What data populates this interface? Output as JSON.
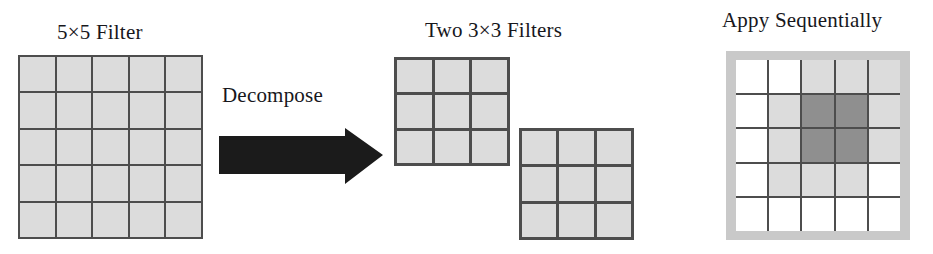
{
  "figure": {
    "kind": "filter-decomposition-diagram",
    "panels": {
      "source": {
        "title": "5×5 Filter",
        "rows": 5,
        "cols": 5,
        "cell_shades": [
          [
            "light",
            "light",
            "light",
            "light",
            "light"
          ],
          [
            "light",
            "light",
            "light",
            "light",
            "light"
          ],
          [
            "light",
            "light",
            "light",
            "light",
            "light"
          ],
          [
            "light",
            "light",
            "light",
            "light",
            "light"
          ],
          [
            "light",
            "light",
            "light",
            "light",
            "light"
          ]
        ]
      },
      "transform": {
        "label": "Decompose",
        "arrow_icon": "right-arrow-icon",
        "arrow_color": "#1b1b1b",
        "direction": "right"
      },
      "decomposed": {
        "title": "Two 3×3 Filters",
        "filters": [
          {
            "name": "first-3x3-filter",
            "rows": 3,
            "cols": 3,
            "cell_shades": [
              [
                "light",
                "light",
                "light"
              ],
              [
                "light",
                "light",
                "light"
              ],
              [
                "light",
                "light",
                "light"
              ]
            ]
          },
          {
            "name": "second-3x3-filter",
            "rows": 3,
            "cols": 3,
            "cell_shades": [
              [
                "light",
                "light",
                "light"
              ],
              [
                "light",
                "light",
                "light"
              ],
              [
                "light",
                "light",
                "light"
              ]
            ]
          }
        ]
      },
      "result": {
        "title": "Appy Sequentially",
        "rows": 5,
        "cols": 5,
        "frame_color": "#c9c9c9",
        "cell_shades": [
          [
            "white",
            "white",
            "light",
            "light",
            "light"
          ],
          [
            "white",
            "light",
            "dark",
            "dark",
            "light"
          ],
          [
            "white",
            "light",
            "dark",
            "dark",
            "light"
          ],
          [
            "white",
            "light",
            "light",
            "light",
            "white"
          ],
          [
            "white",
            "white",
            "white",
            "white",
            "white"
          ]
        ]
      }
    },
    "colors": {
      "cell_light": "#dcdcdc",
      "cell_dark": "#8f8f8f",
      "cell_white": "#ffffff",
      "gridline": "#4d4d4d",
      "frame_gray": "#c9c9c9",
      "text": "#17171c",
      "background": "#ffffff"
    }
  }
}
